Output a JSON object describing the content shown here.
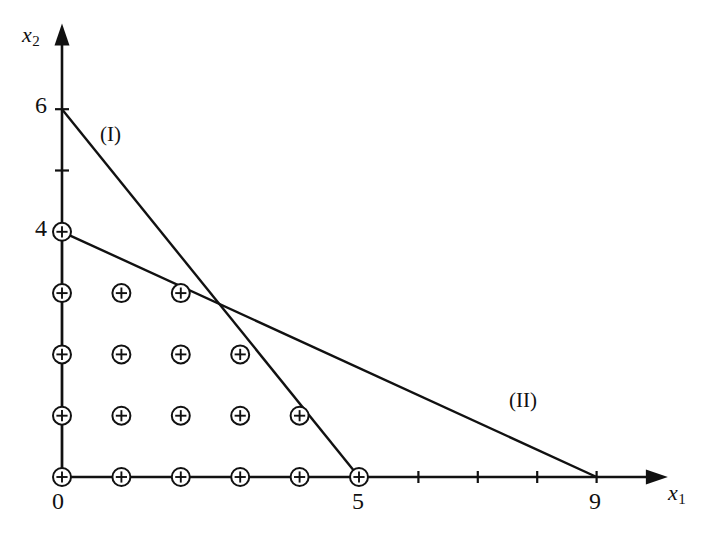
{
  "figure": {
    "type": "math-plot",
    "background_color": "#ffffff",
    "ink_color": "#111111"
  },
  "axes": {
    "x": {
      "label": "x",
      "subscript": "1",
      "pixel_origin": 62,
      "pixel_per_unit": 59.4,
      "arrow": true,
      "ticks": [
        {
          "value": 0,
          "label": "0",
          "show_label": true
        },
        {
          "value": 1,
          "label": "",
          "show_label": false
        },
        {
          "value": 2,
          "label": "",
          "show_label": false
        },
        {
          "value": 3,
          "label": "",
          "show_label": false
        },
        {
          "value": 4,
          "label": "",
          "show_label": false
        },
        {
          "value": 5,
          "label": "5",
          "show_label": true
        },
        {
          "value": 6,
          "label": "",
          "show_label": false
        },
        {
          "value": 7,
          "label": "",
          "show_label": false
        },
        {
          "value": 8,
          "label": "",
          "show_label": false
        },
        {
          "value": 9,
          "label": "9",
          "show_label": true
        }
      ],
      "range": [
        0,
        10.2
      ]
    },
    "y": {
      "label": "x",
      "subscript": "2",
      "pixel_origin": 477,
      "pixel_per_unit": 61.3,
      "arrow": true,
      "ticks": [
        {
          "value": 4,
          "label": "4",
          "show_label": true
        },
        {
          "value": 5,
          "label": "",
          "show_label": false
        },
        {
          "value": 6,
          "label": "6",
          "show_label": true
        }
      ],
      "range": [
        0,
        7.4
      ]
    }
  },
  "constraint_lines": [
    {
      "name": "(I)",
      "from": {
        "x": 0,
        "y": 6
      },
      "to": {
        "x": 5,
        "y": 0
      },
      "equation": "6x1 + 5x2 = 30",
      "label": "(I)"
    },
    {
      "name": "(II)",
      "from": {
        "x": 0,
        "y": 4
      },
      "to": {
        "x": 9,
        "y": 0
      },
      "equation": "4x1 + 9x2 = 36",
      "label": "(II)"
    }
  ],
  "intersection": {
    "x": 2.74,
    "y": 2.92
  },
  "lattice_points": {
    "marker": "circled-plus",
    "radius": 9,
    "rows": [
      {
        "y": 0,
        "xs": [
          0,
          1,
          2,
          3,
          4,
          5
        ]
      },
      {
        "y": 1,
        "xs": [
          0,
          1,
          2,
          3,
          4
        ]
      },
      {
        "y": 2,
        "xs": [
          0,
          1,
          2,
          3
        ]
      },
      {
        "y": 3,
        "xs": [
          0,
          1,
          2
        ]
      },
      {
        "y": 4,
        "xs": [
          0
        ]
      }
    ],
    "count": 18
  },
  "region_edges": [
    {
      "from": {
        "x": 0,
        "y": 0
      },
      "to": {
        "x": 5,
        "y": 0
      }
    },
    {
      "from": {
        "x": 0,
        "y": 0
      },
      "to": {
        "x": 0,
        "y": 4
      }
    }
  ]
}
